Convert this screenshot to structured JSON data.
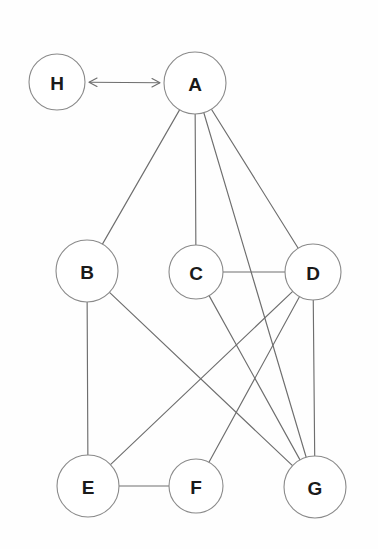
{
  "diagram": {
    "type": "node-link-graph",
    "canvas": {
      "width": 378,
      "height": 549
    },
    "colors": {
      "background": "#fefefe",
      "node_fill": "#ffffff",
      "node_stroke": "#8a8a8a",
      "edge_stroke": "#6e6e6e",
      "label_color": "#1a1a1a"
    },
    "nodes": [
      {
        "id": "H",
        "label": "H",
        "cx": 57,
        "cy": 82,
        "r": 28
      },
      {
        "id": "A",
        "label": "A",
        "cx": 195,
        "cy": 83,
        "r": 31
      },
      {
        "id": "B",
        "label": "B",
        "cx": 87,
        "cy": 271,
        "r": 31
      },
      {
        "id": "C",
        "label": "C",
        "cx": 196,
        "cy": 272,
        "r": 27
      },
      {
        "id": "D",
        "label": "D",
        "cx": 313,
        "cy": 272,
        "r": 28
      },
      {
        "id": "E",
        "label": "E",
        "cx": 88,
        "cy": 486,
        "r": 31
      },
      {
        "id": "F",
        "label": "F",
        "cx": 196,
        "cy": 486,
        "r": 27
      },
      {
        "id": "G",
        "label": "G",
        "cx": 315,
        "cy": 487,
        "r": 31
      }
    ],
    "edges": [
      {
        "id": "H-A",
        "from": "H",
        "to": "A",
        "style": "double-arrow"
      },
      {
        "id": "A-B",
        "from": "A",
        "to": "B",
        "style": "plain"
      },
      {
        "id": "A-C",
        "from": "A",
        "to": "C",
        "style": "plain"
      },
      {
        "id": "A-G",
        "from": "A",
        "to": "G",
        "style": "plain"
      },
      {
        "id": "A-D",
        "from": "A",
        "to": "D",
        "style": "plain"
      },
      {
        "id": "C-D",
        "from": "C",
        "to": "D",
        "style": "plain"
      },
      {
        "id": "C-G",
        "from": "C",
        "to": "G",
        "style": "plain"
      },
      {
        "id": "B-E",
        "from": "B",
        "to": "E",
        "style": "plain"
      },
      {
        "id": "B-G",
        "from": "B",
        "to": "G",
        "style": "plain"
      },
      {
        "id": "D-E",
        "from": "D",
        "to": "E",
        "style": "plain"
      },
      {
        "id": "D-F",
        "from": "D",
        "to": "F",
        "style": "plain"
      },
      {
        "id": "D-G",
        "from": "D",
        "to": "G",
        "style": "plain"
      },
      {
        "id": "E-F",
        "from": "E",
        "to": "F",
        "style": "plain"
      }
    ]
  }
}
